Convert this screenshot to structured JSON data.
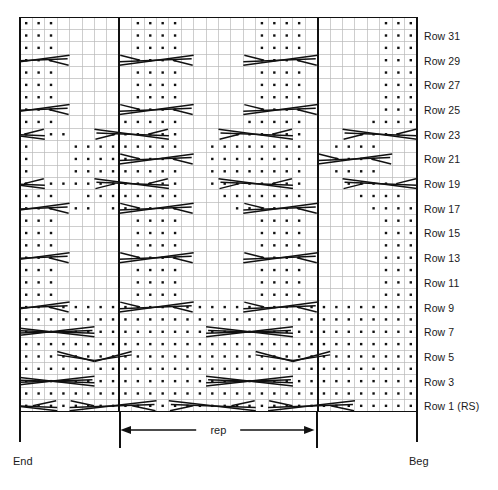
{
  "chart": {
    "type": "knitting-chart",
    "columns": 32,
    "rows": 32,
    "cell_width": 12.4,
    "cell_height": 12.35,
    "grid_line_color": "#b9b9b9",
    "border_color": "#111111",
    "symbol_color": "#111111",
    "background_color": "#ffffff",
    "repeat": {
      "label": "rep",
      "start_column": 9,
      "end_column": 24,
      "width_columns": 15
    },
    "edges": {
      "end_label": "End",
      "beg_label": "Beg"
    },
    "row_labels": [
      {
        "row": 31,
        "text": "Row 31"
      },
      {
        "row": 29,
        "text": "Row 29"
      },
      {
        "row": 27,
        "text": "Row 27"
      },
      {
        "row": 25,
        "text": "Row 25"
      },
      {
        "row": 23,
        "text": "Row 23"
      },
      {
        "row": 21,
        "text": "Row 21"
      },
      {
        "row": 19,
        "text": "Row 19"
      },
      {
        "row": 17,
        "text": "Row 17"
      },
      {
        "row": 15,
        "text": "Row 15"
      },
      {
        "row": 13,
        "text": "Row 13"
      },
      {
        "row": 11,
        "text": "Row 11"
      },
      {
        "row": 9,
        "text": "Row 9"
      },
      {
        "row": 7,
        "text": "Row 7"
      },
      {
        "row": 5,
        "text": "Row 5"
      },
      {
        "row": 3,
        "text": "Row 3"
      },
      {
        "row": 1,
        "text": "Row 1 (RS)"
      }
    ],
    "legend_symbols": [
      {
        "name": "purl-dot",
        "glyph": "•",
        "meaning": "purl on RS"
      },
      {
        "name": "cable-cross",
        "glyph": "><",
        "meaning": "cable crossing"
      }
    ],
    "purl_dots": [
      {
        "row": 32,
        "cols": [
          1,
          2,
          3,
          10,
          11,
          12,
          13,
          20,
          21,
          22,
          23,
          30,
          31,
          32
        ]
      },
      {
        "row": 31,
        "cols": [
          1,
          2,
          3,
          10,
          11,
          12,
          13,
          20,
          21,
          22,
          23,
          30,
          31,
          32
        ]
      },
      {
        "row": 30,
        "cols": [
          1,
          2,
          3,
          10,
          11,
          12,
          13,
          20,
          21,
          22,
          23,
          30,
          31,
          32
        ]
      },
      {
        "row": 29,
        "cols": [
          1,
          2,
          3,
          10,
          11,
          12,
          13,
          20,
          21,
          22,
          23,
          30,
          31,
          32
        ]
      },
      {
        "row": 28,
        "cols": [
          1,
          2,
          3,
          10,
          11,
          12,
          13,
          20,
          21,
          22,
          23,
          30,
          31,
          32
        ]
      },
      {
        "row": 27,
        "cols": [
          1,
          2,
          3,
          10,
          11,
          12,
          13,
          20,
          21,
          22,
          23,
          30,
          31,
          32
        ]
      },
      {
        "row": 26,
        "cols": [
          1,
          2,
          3,
          10,
          11,
          12,
          13,
          20,
          21,
          22,
          23,
          30,
          31,
          32
        ]
      },
      {
        "row": 25,
        "cols": [
          1,
          2,
          3,
          10,
          11,
          12,
          13,
          20,
          21,
          22,
          23,
          30,
          31,
          32
        ]
      },
      {
        "row": 24,
        "cols": [
          1,
          2,
          3,
          9,
          10,
          11,
          12,
          13,
          19,
          20,
          21,
          22,
          23,
          29,
          30,
          31,
          32
        ]
      },
      {
        "row": 23,
        "cols": [
          1,
          3,
          4,
          8,
          9,
          10,
          11,
          12,
          13,
          18,
          19,
          20,
          21,
          22,
          23,
          28,
          29,
          30,
          31
        ]
      },
      {
        "row": 22,
        "cols": [
          1,
          5,
          6,
          7,
          8,
          9,
          10,
          11,
          12,
          13,
          16,
          17,
          18,
          19,
          20,
          21,
          22,
          23,
          26,
          27,
          28,
          29
        ]
      },
      {
        "row": 21,
        "cols": [
          1,
          5,
          6,
          7,
          8,
          9,
          10,
          11,
          12,
          13,
          16,
          17,
          18,
          19,
          20,
          21,
          22,
          23,
          26,
          27,
          28,
          29
        ]
      },
      {
        "row": 20,
        "cols": [
          1,
          5,
          6,
          7,
          8,
          9,
          10,
          11,
          12,
          13,
          16,
          17,
          18,
          19,
          20,
          21,
          22,
          23,
          26,
          27,
          28,
          29
        ]
      },
      {
        "row": 19,
        "cols": [
          1,
          3,
          4,
          5,
          6,
          7,
          8,
          9,
          10,
          11,
          12,
          13,
          16,
          17,
          18,
          19,
          20,
          21,
          22,
          23,
          27,
          28,
          29,
          30
        ]
      },
      {
        "row": 18,
        "cols": [
          1,
          2,
          3,
          6,
          7,
          8,
          9,
          10,
          11,
          12,
          13,
          17,
          18,
          19,
          20,
          21,
          22,
          23,
          28,
          29,
          30,
          31
        ]
      },
      {
        "row": 17,
        "cols": [
          1,
          2,
          3,
          5,
          6,
          8,
          9,
          10,
          11,
          12,
          13,
          18,
          19,
          20,
          21,
          22,
          23,
          29,
          30,
          31,
          32
        ]
      },
      {
        "row": 16,
        "cols": [
          1,
          2,
          3,
          10,
          11,
          12,
          13,
          20,
          21,
          22,
          23,
          30,
          31,
          32
        ]
      },
      {
        "row": 15,
        "cols": [
          1,
          2,
          3,
          10,
          11,
          12,
          13,
          20,
          21,
          22,
          23,
          30,
          31,
          32
        ]
      },
      {
        "row": 14,
        "cols": [
          1,
          2,
          3,
          10,
          11,
          12,
          13,
          20,
          21,
          22,
          23,
          30,
          31,
          32
        ]
      },
      {
        "row": 13,
        "cols": [
          1,
          2,
          3,
          10,
          11,
          12,
          13,
          20,
          21,
          22,
          23,
          30,
          31,
          32
        ]
      },
      {
        "row": 12,
        "cols": [
          1,
          2,
          3,
          10,
          11,
          12,
          13,
          20,
          21,
          22,
          23,
          30,
          31,
          32
        ]
      },
      {
        "row": 11,
        "cols": [
          1,
          2,
          3,
          10,
          11,
          12,
          13,
          20,
          21,
          22,
          23,
          30,
          31,
          32
        ]
      },
      {
        "row": 10,
        "cols": [
          1,
          2,
          3,
          10,
          11,
          12,
          13,
          20,
          21,
          22,
          23,
          30,
          31,
          32
        ]
      },
      {
        "row": 9,
        "cols": [
          1,
          2,
          3,
          4,
          5,
          6,
          7,
          8,
          9,
          10,
          11,
          12,
          13,
          14,
          15,
          16,
          17,
          18,
          19,
          20,
          21,
          22,
          23,
          24,
          25,
          26,
          27,
          28,
          29,
          30,
          31,
          32
        ]
      },
      {
        "row": 8,
        "cols": [
          1,
          2,
          3,
          4,
          5,
          6,
          7,
          8,
          9,
          10,
          11,
          12,
          13,
          14,
          15,
          16,
          17,
          18,
          19,
          20,
          21,
          22,
          23,
          24,
          25,
          26,
          27,
          28,
          29,
          30,
          31,
          32
        ]
      },
      {
        "row": 7,
        "cols": [
          1,
          2,
          3,
          4,
          5,
          6,
          7,
          8,
          9,
          10,
          11,
          12,
          13,
          14,
          15,
          16,
          17,
          18,
          19,
          20,
          21,
          22,
          23,
          24,
          25,
          26,
          27,
          28,
          29,
          30,
          31,
          32
        ]
      },
      {
        "row": 6,
        "cols": [
          1,
          2,
          3,
          4,
          5,
          6,
          7,
          8,
          9,
          10,
          11,
          12,
          13,
          14,
          15,
          16,
          17,
          18,
          19,
          20,
          21,
          22,
          23,
          24,
          25,
          26,
          27,
          28,
          29,
          30,
          31,
          32
        ]
      },
      {
        "row": 5,
        "cols": [
          1,
          2,
          3,
          4,
          5,
          6,
          7,
          8,
          9,
          10,
          11,
          12,
          13,
          14,
          15,
          16,
          17,
          18,
          19,
          20,
          21,
          22,
          23,
          24,
          25,
          26,
          27,
          28,
          29,
          30,
          31,
          32
        ]
      },
      {
        "row": 4,
        "cols": [
          1,
          2,
          3,
          4,
          5,
          6,
          7,
          8,
          9,
          10,
          11,
          12,
          13,
          14,
          15,
          16,
          17,
          18,
          19,
          20,
          21,
          22,
          23,
          24,
          25,
          26,
          27,
          28,
          29,
          30,
          31,
          32
        ]
      },
      {
        "row": 3,
        "cols": [
          1,
          2,
          3,
          4,
          5,
          6,
          7,
          8,
          9,
          10,
          11,
          12,
          13,
          14,
          15,
          16,
          17,
          18,
          19,
          20,
          21,
          22,
          23,
          24,
          25,
          26,
          27,
          28,
          29,
          30,
          31,
          32
        ]
      },
      {
        "row": 2,
        "cols": [
          1,
          2,
          3,
          4,
          5,
          6,
          7,
          8,
          9,
          10,
          11,
          12,
          13,
          14,
          15,
          16,
          17,
          18,
          19,
          20,
          21,
          22,
          23,
          24,
          25,
          26,
          27,
          28,
          29,
          30,
          31,
          32
        ]
      },
      {
        "row": 1,
        "cols": [
          1,
          2,
          3,
          4,
          5,
          6,
          7,
          8,
          9,
          10,
          11,
          12,
          13,
          14,
          15,
          16,
          17,
          18,
          19,
          20,
          21,
          22,
          23,
          24,
          25,
          26,
          27,
          28,
          29,
          30,
          31,
          32
        ]
      }
    ],
    "cables": [
      {
        "row": 29,
        "col": 4,
        "span": 6,
        "dir": "right"
      },
      {
        "row": 29,
        "col": 14,
        "span": 6,
        "dir": "right"
      },
      {
        "row": 29,
        "col": 24,
        "span": 6,
        "dir": "right"
      },
      {
        "row": 25,
        "col": 4,
        "span": 6,
        "dir": "right"
      },
      {
        "row": 25,
        "col": 14,
        "span": 6,
        "dir": "right"
      },
      {
        "row": 25,
        "col": 24,
        "span": 6,
        "dir": "right"
      },
      {
        "row": 23,
        "col": 2,
        "span": 6,
        "dir": "left"
      },
      {
        "row": 23,
        "col": 12,
        "span": 6,
        "dir": "left"
      },
      {
        "row": 23,
        "col": 22,
        "span": 6,
        "dir": "left"
      },
      {
        "row": 23,
        "col": 32,
        "span": 6,
        "dir": "left"
      },
      {
        "row": 21,
        "col": 14,
        "span": 6,
        "dir": "right"
      },
      {
        "row": 21,
        "col": 30,
        "span": 6,
        "dir": "right"
      },
      {
        "row": 19,
        "col": 2,
        "span": 6,
        "dir": "left"
      },
      {
        "row": 19,
        "col": 12,
        "span": 6,
        "dir": "left"
      },
      {
        "row": 19,
        "col": 22,
        "span": 6,
        "dir": "left"
      },
      {
        "row": 19,
        "col": 32,
        "span": 6,
        "dir": "left"
      },
      {
        "row": 17,
        "col": 4,
        "span": 6,
        "dir": "right"
      },
      {
        "row": 17,
        "col": 14,
        "span": 6,
        "dir": "right"
      },
      {
        "row": 17,
        "col": 24,
        "span": 6,
        "dir": "right"
      },
      {
        "row": 13,
        "col": 4,
        "span": 6,
        "dir": "right"
      },
      {
        "row": 13,
        "col": 14,
        "span": 6,
        "dir": "right"
      },
      {
        "row": 13,
        "col": 24,
        "span": 6,
        "dir": "right"
      },
      {
        "row": 9,
        "col": 4,
        "span": 6,
        "dir": "right"
      },
      {
        "row": 9,
        "col": 14,
        "span": 6,
        "dir": "right"
      },
      {
        "row": 9,
        "col": 24,
        "span": 6,
        "dir": "right"
      },
      {
        "row": 7,
        "col": 6,
        "span": 7,
        "dir": "cross"
      },
      {
        "row": 7,
        "col": 22,
        "span": 7,
        "dir": "cross"
      },
      {
        "row": 5,
        "col": 9,
        "span": 6,
        "dir": "xcross"
      },
      {
        "row": 5,
        "col": 25,
        "span": 6,
        "dir": "xcross"
      },
      {
        "row": 3,
        "col": 6,
        "span": 7,
        "dir": "cross"
      },
      {
        "row": 3,
        "col": 22,
        "span": 7,
        "dir": "cross"
      },
      {
        "row": 1,
        "col": 3,
        "span": 7,
        "dir": "left"
      },
      {
        "row": 1,
        "col": 19,
        "span": 7,
        "dir": "left"
      },
      {
        "row": 1,
        "col": 11,
        "span": 7,
        "dir": "right"
      },
      {
        "row": 1,
        "col": 27,
        "span": 7,
        "dir": "right"
      }
    ]
  }
}
